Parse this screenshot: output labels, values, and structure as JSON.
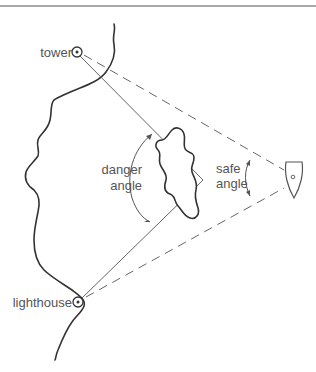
{
  "diagram": {
    "type": "navigation danger-angle diagram",
    "labels": {
      "tower": "tower",
      "lighthouse": "lighthouse",
      "danger_angle_line1": "danger",
      "danger_angle_line2": "angle",
      "safe_angle_line1": "safe",
      "safe_angle_line2": "angle"
    },
    "landmarks": [
      {
        "name": "tower",
        "x": 77,
        "y": 52
      },
      {
        "name": "lighthouse",
        "x": 78,
        "y": 302
      }
    ],
    "vessel": {
      "name": "boat",
      "x": 293,
      "y": 178
    },
    "hazard": {
      "name": "rocks",
      "approx_center_x": 178,
      "approx_center_y": 180
    },
    "colors": {
      "line": "#666666",
      "coast": "#333333",
      "text": "#555555"
    }
  }
}
